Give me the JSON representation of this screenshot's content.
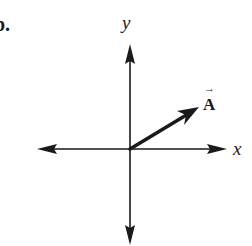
{
  "figure": {
    "part_label": "b.",
    "axes": {
      "x_label": "x",
      "y_label": "y"
    },
    "vector": {
      "name": "A",
      "arrow_accent": "→",
      "direction": "first quadrant, ~30 degrees above +x axis"
    },
    "colors": {
      "ink": "#1a1a1a",
      "background": "#ffffff"
    }
  }
}
